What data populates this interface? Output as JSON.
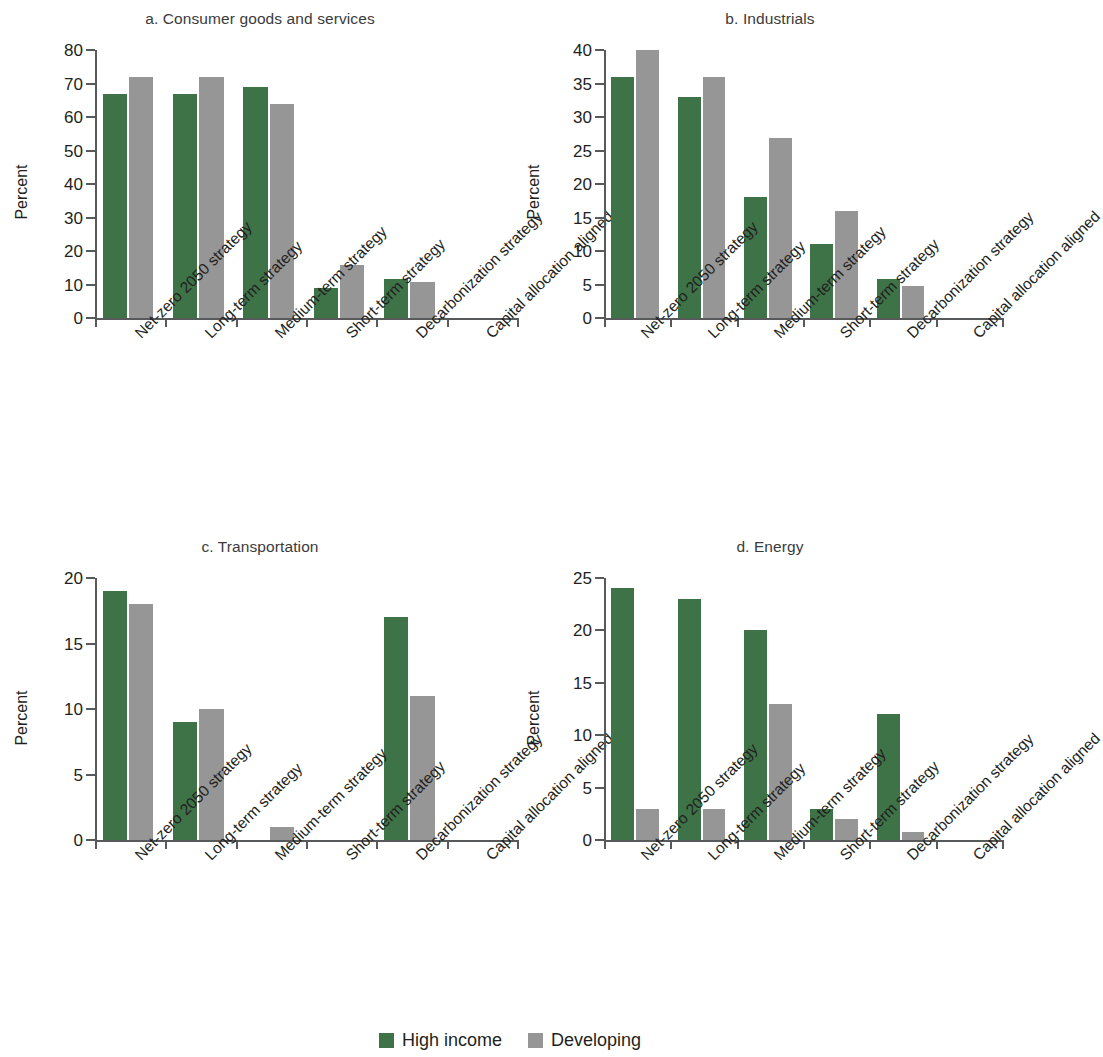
{
  "figure": {
    "background": "#ffffff",
    "series_colors": {
      "high_income": "#3d7347",
      "developing": "#969696"
    }
  },
  "legend": {
    "position": "bottom-center",
    "items": [
      {
        "label": "High income",
        "color": "#3d7347",
        "key": "high_income"
      },
      {
        "label": "Developing",
        "color": "#969696",
        "key": "developing"
      }
    ]
  },
  "chart_data": [
    {
      "type": "bar",
      "panel": "a",
      "title": "a. Consumer goods and services",
      "xlabel": "",
      "ylabel": "Percent",
      "ylim": [
        0,
        80
      ],
      "yticks": [
        0,
        10,
        20,
        30,
        40,
        50,
        60,
        70,
        80
      ],
      "grid": false,
      "categories": [
        "Net-zero 2050 strategy",
        "Long-term strategy",
        "Medium-term strategy",
        "Short-term strategy",
        "Decarbonization strategy",
        "Capital allocation aligned"
      ],
      "series": [
        {
          "name": "High income",
          "color": "#3d7347",
          "values": [
            67,
            67,
            69,
            9,
            11.7,
            0
          ]
        },
        {
          "name": "Developing",
          "color": "#969696",
          "values": [
            72,
            72,
            64,
            15.8,
            10.7,
            0
          ]
        }
      ]
    },
    {
      "type": "bar",
      "panel": "b",
      "title": "b. Industrials",
      "xlabel": "",
      "ylabel": "Percent",
      "ylim": [
        0,
        40
      ],
      "yticks": [
        0,
        5,
        10,
        15,
        20,
        25,
        30,
        35,
        40
      ],
      "grid": false,
      "categories": [
        "Net-zero 2050 strategy",
        "Long-term strategy",
        "Medium-term strategy",
        "Short-term strategy",
        "Decarbonization strategy",
        "Capital allocation aligned"
      ],
      "series": [
        {
          "name": "High income",
          "color": "#3d7347",
          "values": [
            36,
            33,
            18,
            11,
            5.8,
            0
          ]
        },
        {
          "name": "Developing",
          "color": "#969696",
          "values": [
            40,
            36,
            26.8,
            15.9,
            4.8,
            0
          ]
        }
      ]
    },
    {
      "type": "bar",
      "panel": "c",
      "title": "c. Transportation",
      "xlabel": "",
      "ylabel": "Percent",
      "ylim": [
        0,
        20
      ],
      "yticks": [
        0,
        5,
        10,
        15,
        20
      ],
      "grid": false,
      "categories": [
        "Net-zero 2050 strategy",
        "Long-term strategy",
        "Medium-term strategy",
        "Short-term strategy",
        "Decarbonization strategy",
        "Capital allocation aligned"
      ],
      "series": [
        {
          "name": "High income",
          "color": "#3d7347",
          "values": [
            19,
            9,
            0,
            0,
            17,
            0
          ]
        },
        {
          "name": "Developing",
          "color": "#969696",
          "values": [
            18,
            10,
            1,
            0,
            11,
            0
          ]
        }
      ]
    },
    {
      "type": "bar",
      "panel": "d",
      "title": "d. Energy",
      "xlabel": "",
      "ylabel": "Percent",
      "ylim": [
        0,
        25
      ],
      "yticks": [
        0,
        5,
        10,
        15,
        20,
        25
      ],
      "grid": false,
      "categories": [
        "Net-zero 2050 strategy",
        "Long-term strategy",
        "Medium-term strategy",
        "Short-term strategy",
        "Decarbonization strategy",
        "Capital allocation aligned"
      ],
      "series": [
        {
          "name": "High income",
          "color": "#3d7347",
          "values": [
            24,
            23,
            20,
            3,
            12,
            0
          ]
        },
        {
          "name": "Developing",
          "color": "#969696",
          "values": [
            3,
            3,
            13,
            2,
            0.8,
            0
          ]
        }
      ]
    }
  ]
}
